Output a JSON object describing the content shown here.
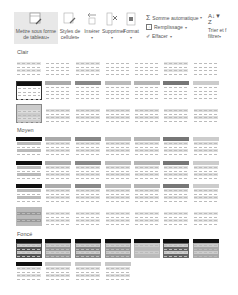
{
  "ribbon": {
    "format_as_table": {
      "line1": "Mettre sous forme",
      "line2": "de tableau",
      "icon": "table-format-icon"
    },
    "cell_styles": {
      "line1": "Styles de",
      "line2": "cellules",
      "icon": "cell-styles-icon"
    },
    "insert": {
      "line1": "Insérer",
      "icon": "insert-cells-icon"
    },
    "delete": {
      "line1": "Supprimer",
      "icon": "delete-cells-icon"
    },
    "format": {
      "line1": "Format",
      "icon": "format-cells-icon"
    },
    "autosum": {
      "label": "Somme automatique",
      "icon": "sigma-icon"
    },
    "fill": {
      "label": "Remplissage",
      "icon": "fill-down-icon"
    },
    "clear": {
      "label": "Effacer",
      "icon": "eraser-icon"
    },
    "sort_filter": {
      "line1": "Trier et f",
      "line2": "filtrer",
      "icon": "sort-filter-icon"
    }
  },
  "gallery": {
    "sections": [
      {
        "label": "Clair",
        "rows": 3
      },
      {
        "label": "Moyen",
        "rows": 4
      },
      {
        "label": "Foncé",
        "rows": 2
      }
    ],
    "columns": 7,
    "accent": "#000000"
  }
}
